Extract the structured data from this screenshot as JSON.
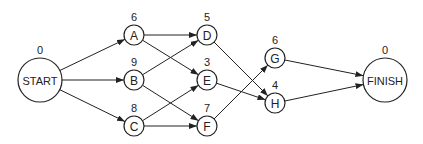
{
  "diagram": {
    "type": "directed-network",
    "colors": {
      "stroke": "#222222",
      "background": "#ffffff"
    },
    "nodes": [
      {
        "id": "START",
        "label": "START",
        "value": "0",
        "x": 40,
        "y": 80,
        "r": 22
      },
      {
        "id": "A",
        "label": "A",
        "value": "6",
        "x": 134,
        "y": 35,
        "r": 10
      },
      {
        "id": "B",
        "label": "B",
        "value": "9",
        "x": 134,
        "y": 80,
        "r": 10
      },
      {
        "id": "C",
        "label": "C",
        "value": "8",
        "x": 134,
        "y": 126,
        "r": 10
      },
      {
        "id": "D",
        "label": "D",
        "value": "5",
        "x": 207,
        "y": 35,
        "r": 10
      },
      {
        "id": "E",
        "label": "E",
        "value": "3",
        "x": 207,
        "y": 80,
        "r": 10
      },
      {
        "id": "F",
        "label": "F",
        "value": "7",
        "x": 207,
        "y": 126,
        "r": 10
      },
      {
        "id": "G",
        "label": "G",
        "value": "6",
        "x": 275,
        "y": 58,
        "r": 10
      },
      {
        "id": "H",
        "label": "H",
        "value": "4",
        "x": 275,
        "y": 103,
        "r": 10
      },
      {
        "id": "FINISH",
        "label": "FINISH",
        "value": "0",
        "x": 385,
        "y": 80,
        "r": 22
      }
    ],
    "edges": [
      {
        "from": "START",
        "to": "A"
      },
      {
        "from": "START",
        "to": "B"
      },
      {
        "from": "START",
        "to": "C"
      },
      {
        "from": "A",
        "to": "D"
      },
      {
        "from": "A",
        "to": "E"
      },
      {
        "from": "B",
        "to": "D"
      },
      {
        "from": "B",
        "to": "F"
      },
      {
        "from": "C",
        "to": "E"
      },
      {
        "from": "C",
        "to": "F"
      },
      {
        "from": "D",
        "to": "H"
      },
      {
        "from": "E",
        "to": "H"
      },
      {
        "from": "F",
        "to": "G"
      },
      {
        "from": "G",
        "to": "FINISH"
      },
      {
        "from": "H",
        "to": "FINISH"
      }
    ]
  }
}
